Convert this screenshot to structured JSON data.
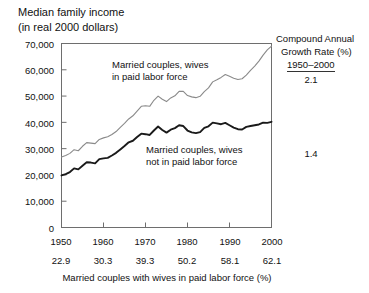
{
  "title": {
    "line1": "Median family income",
    "line2": "(in real 2000 dollars)"
  },
  "axis": {
    "y_ticks": [
      "70,000",
      "60,000",
      "50,000",
      "40,000",
      "30,000",
      "20,000",
      "10,000",
      "0"
    ],
    "x_ticks_years": [
      "1950",
      "1960",
      "1970",
      "1980",
      "1990",
      "2000"
    ],
    "x_ticks_percent": [
      "22.9",
      "30.3",
      "39.3",
      "50.2",
      "58.1",
      "62.1"
    ],
    "x_title": "Married couples with wives in paid labor force (%)"
  },
  "series_labels": {
    "upper_line1": "Married couples, wives",
    "upper_line2": "in paid labor force",
    "lower_line1": "Married couples, wives",
    "lower_line2": "not in paid labor force"
  },
  "cagr_panel": {
    "head_line1": "Compound Annual",
    "head_line2": "Growth Rate (%)",
    "period": "1950–2000",
    "value_upper": "2.1",
    "value_lower": "1.4"
  },
  "colors": {
    "upper_series": "#8a8a8a",
    "lower_series": "#1a1a1a",
    "frame": "#6e6e6e",
    "text": "#111111",
    "background": "#ffffff"
  },
  "chart_data": {
    "type": "line",
    "title": "Median family income (in real 2000 dollars)",
    "subtitle": "",
    "xlabel": "Married couples with wives in paid labor force (%)",
    "ylabel": "Median family income (in real 2000 dollars)",
    "xlim": [
      1950,
      2000
    ],
    "ylim": [
      0,
      70000
    ],
    "grid": false,
    "legend_position": "inline-annotation",
    "x_tick_labels_primary": [
      "1950",
      "1960",
      "1970",
      "1980",
      "1990",
      "2000"
    ],
    "x_tick_labels_secondary": [
      "22.9",
      "30.3",
      "39.3",
      "50.2",
      "58.1",
      "62.1"
    ],
    "y_tick_labels": [
      "0",
      "10,000",
      "20,000",
      "30,000",
      "40,000",
      "50,000",
      "60,000",
      "70,000"
    ],
    "annotations": [
      {
        "text": "Compound Annual Growth Rate (%) 1950–2000",
        "value": "2.1",
        "series": "Married couples, wives in paid labor force"
      },
      {
        "text": "Compound Annual Growth Rate (%) 1950–2000",
        "value": "1.4",
        "series": "Married couples, wives not in paid labor force"
      }
    ],
    "x": [
      1950,
      1951,
      1952,
      1953,
      1954,
      1955,
      1956,
      1957,
      1958,
      1959,
      1960,
      1961,
      1962,
      1963,
      1964,
      1965,
      1966,
      1967,
      1968,
      1969,
      1970,
      1971,
      1972,
      1973,
      1974,
      1975,
      1976,
      1977,
      1978,
      1979,
      1980,
      1981,
      1982,
      1983,
      1984,
      1985,
      1986,
      1987,
      1988,
      1989,
      1990,
      1991,
      1992,
      1993,
      1994,
      1995,
      1996,
      1997,
      1998,
      1999,
      2000
    ],
    "series": [
      {
        "name": "Married couples, wives in paid labor force",
        "color": "#8a8a8a",
        "cagr_1950_2000": 2.1,
        "values": [
          26800,
          27400,
          28200,
          29600,
          29200,
          30900,
          32300,
          32100,
          31900,
          33500,
          34100,
          34500,
          35400,
          36500,
          38100,
          39600,
          41300,
          42500,
          44300,
          46100,
          46300,
          46100,
          48400,
          50000,
          48800,
          47900,
          49300,
          50100,
          51800,
          51800,
          50200,
          49700,
          49400,
          49900,
          51700,
          53100,
          55400,
          56200,
          57100,
          58200,
          57500,
          56800,
          56300,
          56600,
          58000,
          59800,
          61400,
          63300,
          65600,
          67600,
          69000
        ]
      },
      {
        "name": "Married couples, wives not in paid labor force",
        "color": "#1a1a1a",
        "cagr_1950_2000": 1.4,
        "values": [
          19800,
          20300,
          21100,
          22500,
          22100,
          23500,
          24800,
          24700,
          24400,
          26000,
          26300,
          26500,
          27400,
          28400,
          29700,
          31000,
          32400,
          33000,
          34400,
          35700,
          35500,
          35200,
          36900,
          38400,
          37100,
          36100,
          37200,
          37800,
          38900,
          38600,
          36900,
          36200,
          35900,
          36300,
          37900,
          38500,
          39900,
          39600,
          39300,
          39800,
          38900,
          38000,
          37400,
          37300,
          38300,
          38600,
          38900,
          39200,
          39900,
          39800,
          40200
        ]
      }
    ]
  }
}
